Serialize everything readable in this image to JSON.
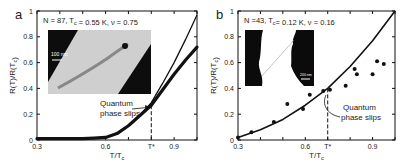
{
  "figure": {
    "panels": [
      {
        "id": "a",
        "label": "a",
        "annotation": "N = 87, T_c = 0.55 K, ν = 0.75",
        "ylabel": "R(T)/R(T_c)",
        "xlabel": "T/T_c",
        "callout": [
          "Quantum",
          "phase slips"
        ],
        "inset_scale_bar": "100 nm",
        "tstar_label": "T*"
      },
      {
        "id": "b",
        "label": "b",
        "annotation": "N =43, T_c= 0.12 K, ν = 0.16",
        "ylabel": "R(T)/R(T_c)",
        "xlabel": "T/T_c",
        "callout": [
          "Quantum",
          "phase slips"
        ],
        "inset_scale_bar": "200 nm",
        "tstar_label": "T*"
      }
    ]
  },
  "chart_data": [
    {
      "type": "line",
      "panel": "a",
      "title": "N = 87, Tc = 0.55 K, ν = 0.75",
      "xlabel": "T/Tc",
      "ylabel": "R(T)/R(Tc)",
      "xlim": [
        0.3,
        1.0
      ],
      "ylim": [
        0,
        1
      ],
      "xticks": [
        0.3,
        0.6,
        0.8,
        0.9
      ],
      "xtick_labels": [
        "0.3",
        "0.6",
        "T*",
        "0.9"
      ],
      "yticks": [
        0,
        0.2,
        0.4,
        0.6,
        0.8,
        1
      ],
      "tstar": 0.8,
      "grid": false,
      "series": [
        {
          "name": "data (thick)",
          "x": [
            0.3,
            0.4,
            0.5,
            0.55,
            0.6,
            0.65,
            0.7,
            0.75,
            0.8,
            0.85,
            0.9,
            0.95,
            1.0
          ],
          "y": [
            0.01,
            0.01,
            0.01,
            0.015,
            0.02,
            0.05,
            0.11,
            0.19,
            0.27,
            0.39,
            0.51,
            0.62,
            0.72
          ]
        },
        {
          "name": "theory (thin)",
          "x": [
            0.75,
            0.8,
            0.85,
            0.9,
            0.95,
            1.0
          ],
          "y": [
            0.19,
            0.29,
            0.44,
            0.6,
            0.78,
            0.97
          ]
        }
      ],
      "annotations": [
        {
          "text": "Quantum phase slips",
          "points_to": [
            0.8,
            0.27
          ]
        }
      ]
    },
    {
      "type": "scatter",
      "panel": "b",
      "title": "N =43, Tc= 0.12 K, ν = 0.16",
      "xlabel": "T/Tc",
      "ylabel": "R(T)/R(Tc)",
      "xlim": [
        0.3,
        1.0
      ],
      "ylim": [
        0,
        1
      ],
      "xticks": [
        0.3,
        0.6,
        0.7,
        0.9
      ],
      "xtick_labels": [
        "0.3",
        "0.6",
        "T*",
        "0.9"
      ],
      "yticks": [
        0,
        0.2,
        0.4,
        0.6,
        0.8,
        1
      ],
      "tstar": 0.7,
      "grid": false,
      "series": [
        {
          "name": "data",
          "x": [
            0.3,
            0.36,
            0.46,
            0.52,
            0.59,
            0.62,
            0.68,
            0.71,
            0.78,
            0.82,
            0.83,
            0.9,
            0.92,
            0.95
          ],
          "y": [
            0.02,
            0.06,
            0.14,
            0.28,
            0.24,
            0.35,
            0.38,
            0.39,
            0.42,
            0.55,
            0.51,
            0.51,
            0.61,
            0.59
          ]
        },
        {
          "name": "theory curve",
          "x": [
            0.3,
            0.4,
            0.5,
            0.6,
            0.7,
            0.8,
            0.9,
            1.0
          ],
          "y": [
            0.02,
            0.08,
            0.16,
            0.27,
            0.4,
            0.57,
            0.77,
            1.0
          ]
        }
      ],
      "annotations": [
        {
          "text": "Quantum phase slips",
          "points_to": [
            0.68,
            0.38
          ]
        }
      ]
    }
  ]
}
